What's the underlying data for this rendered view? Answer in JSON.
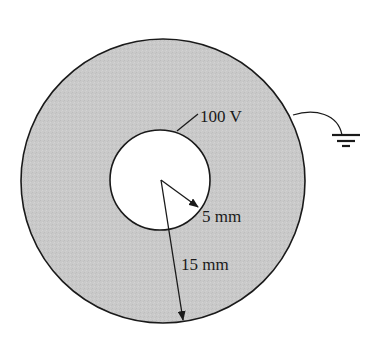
{
  "diagram": {
    "type": "coaxial-conductor-cross-section",
    "colors": {
      "background": "#ffffff",
      "dielectric_fill": "#c9c9c9",
      "inner_fill": "#ffffff",
      "stroke": "#1a1a1a"
    },
    "outer_conductor": {
      "center": [
        163,
        181
      ],
      "radius": 142,
      "grounded": true
    },
    "inner_conductor": {
      "center": [
        160,
        180
      ],
      "radius": 50,
      "potential_label": "100 V"
    },
    "labels": {
      "inner_potential": "100 V",
      "inner_radius": "5 mm",
      "outer_radius": "15 mm"
    },
    "ground_symbol": {
      "name": "ground",
      "anchor": [
        342,
        135
      ]
    }
  }
}
